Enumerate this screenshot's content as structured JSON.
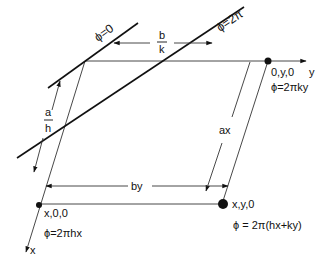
{
  "diagram": {
    "type": "lattice-plane-phase-diagram",
    "axes": {
      "x_label": "x",
      "y_label": "y"
    },
    "planes": [
      {
        "id": "phi-0",
        "label": "ϕ=0"
      },
      {
        "id": "phi-2pi",
        "label": "ϕ=2π"
      }
    ],
    "spacings": {
      "along_y": {
        "num": "b",
        "den": "k"
      },
      "along_x": {
        "num": "a",
        "den": "h"
      }
    },
    "dimensions": {
      "ax": "ax",
      "by": "by"
    },
    "points": [
      {
        "id": "origin-y",
        "coord": "0,y,0",
        "phase": "ϕ=2πky"
      },
      {
        "id": "origin-x",
        "coord": "x,0,0",
        "phase": "ϕ=2πhx"
      },
      {
        "id": "point-xy",
        "coord": "x,y,0",
        "phase": "ϕ = 2π(hx+ky)"
      }
    ],
    "colors": {
      "line": "#111111",
      "thin_line": "#333333",
      "background": "#ffffff"
    }
  }
}
